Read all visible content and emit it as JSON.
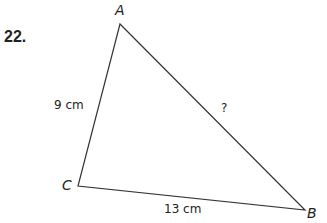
{
  "problem_number": "22.",
  "triangle": {
    "vertices": {
      "A": {
        "label": "A",
        "x": 120,
        "y": 24
      },
      "B": {
        "label": "B",
        "x": 305,
        "y": 210
      },
      "C": {
        "label": "C",
        "x": 78,
        "y": 186
      }
    },
    "sides": {
      "AC": "9 cm",
      "CB": "13 cm",
      "AB": "?"
    }
  }
}
